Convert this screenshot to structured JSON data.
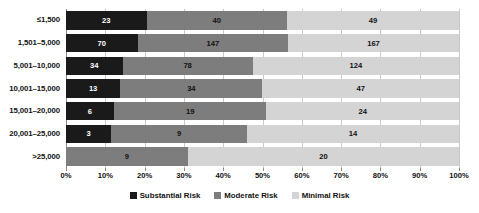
{
  "chart_data": {
    "type": "bar",
    "orientation": "horizontal",
    "stacked": true,
    "normalized": true,
    "title": "",
    "xlabel": "",
    "ylabel": "",
    "xlim": [
      0,
      100
    ],
    "xunit": "%",
    "grid": true,
    "legend_position": "bottom-center",
    "categories": [
      "≤1,500",
      "1,501–5,000",
      "5,001–10,000",
      "10,001–15,000",
      "15,001–20,000",
      "20,001–25,000",
      ">25,000"
    ],
    "xticks": [
      "0%",
      "10%",
      "20%",
      "30%",
      "40%",
      "50%",
      "60%",
      "70%",
      "80%",
      "90%",
      "100%"
    ],
    "xtick_values": [
      0,
      10,
      20,
      30,
      40,
      50,
      60,
      70,
      80,
      90,
      100
    ],
    "series": [
      {
        "name": "Substantial Risk",
        "color": "#1a1a1a",
        "values": [
          23,
          70,
          34,
          13,
          6,
          3,
          0
        ],
        "percents": [
          20.5,
          18.2,
          14.4,
          13.8,
          12.2,
          11.5,
          0
        ]
      },
      {
        "name": "Moderate Risk",
        "color": "#7d7d7d",
        "values": [
          40,
          147,
          78,
          34,
          19,
          9,
          9
        ],
        "percents": [
          35.7,
          38.3,
          33.1,
          36.2,
          38.8,
          34.6,
          31.0
        ]
      },
      {
        "name": "Minimal Risk",
        "color": "#d4d4d4",
        "values": [
          49,
          167,
          124,
          47,
          24,
          14,
          20
        ],
        "percents": [
          43.8,
          43.5,
          52.5,
          50.0,
          49.0,
          53.9,
          69.0
        ]
      }
    ],
    "row_totals": [
      112,
      384,
      236,
      94,
      49,
      26,
      29
    ]
  },
  "legend": {
    "items": [
      {
        "label": "Substantial Risk",
        "color": "#1a1a1a"
      },
      {
        "label": "Moderate Risk",
        "color": "#7d7d7d"
      },
      {
        "label": "Minimal Risk",
        "color": "#d4d4d4"
      }
    ]
  }
}
